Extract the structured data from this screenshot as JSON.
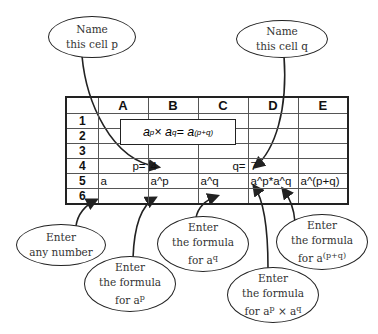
{
  "callouts": {
    "name_p": {
      "line1": "Name",
      "line2": "this cell p"
    },
    "name_q": {
      "line1": "Name",
      "line2": "this cell q"
    },
    "enter_any": {
      "line1": "Enter",
      "line2": "any number"
    },
    "enter_ap": {
      "line1": "Enter",
      "line2": "the formula",
      "line3_prefix": "for a",
      "line3_sup": "p"
    },
    "enter_aq": {
      "line1": "Enter",
      "line2": "the formula",
      "line3_prefix": "for a",
      "line3_sup": "q"
    },
    "enter_apaq": {
      "line1": "Enter",
      "line2": "the formula",
      "line3_prefix": "for a",
      "line3_sup1": "p",
      "line3_mid": " × a",
      "line3_sup2": "q"
    },
    "enter_apq": {
      "line1": "Enter",
      "line2": "the formula",
      "line3_prefix": "for a",
      "line3_sup": "(p+q)"
    }
  },
  "formula": {
    "a1": "a",
    "p": "p",
    "times": " × a",
    "q": "q",
    "eq": " = a",
    "pq": "(p+q)"
  },
  "sheet": {
    "columns": [
      "A",
      "B",
      "C",
      "D",
      "E"
    ],
    "rows": [
      "1",
      "2",
      "3",
      "4",
      "5",
      "6"
    ],
    "cells": {
      "A4": "p=",
      "B4": "4",
      "C4": "q=",
      "D4": "7",
      "A5": "a",
      "B5": "a^p",
      "C5": "a^q",
      "D5": "a^p*a^q",
      "E5": "a^(p+q)"
    }
  }
}
